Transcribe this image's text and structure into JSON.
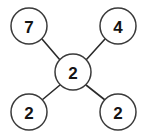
{
  "diagram": {
    "background_color": "#ffffff",
    "node_fill": "#ffffff",
    "node_stroke": "#3a3a3a",
    "edge_color": "#2b2b2b",
    "label_color": "#141414",
    "nodes": [
      {
        "id": "top-left",
        "label": "7",
        "cx": 29,
        "cy": 26,
        "r": 18
      },
      {
        "id": "top-right",
        "label": "4",
        "cx": 118,
        "cy": 26,
        "r": 18
      },
      {
        "id": "center",
        "label": "2",
        "cx": 73,
        "cy": 72,
        "r": 18
      },
      {
        "id": "bottom-left",
        "label": "2",
        "cx": 29,
        "cy": 112,
        "r": 18
      },
      {
        "id": "bottom-right",
        "label": "2",
        "cx": 118,
        "cy": 112,
        "r": 18
      }
    ],
    "edges": [
      {
        "id": "edge-center-top-left",
        "from": "center",
        "to": "top-left",
        "x1": 60,
        "y1": 60,
        "x2": 42,
        "y2": 39
      },
      {
        "id": "edge-center-top-right",
        "from": "center",
        "to": "top-right",
        "x1": 86,
        "y1": 60,
        "x2": 105,
        "y2": 39
      },
      {
        "id": "edge-center-bottom-left",
        "from": "center",
        "to": "bottom-left",
        "x1": 60,
        "y1": 85,
        "x2": 42,
        "y2": 100
      },
      {
        "id": "edge-center-bottom-right",
        "from": "center",
        "to": "bottom-right",
        "x1": 86,
        "y1": 85,
        "x2": 105,
        "y2": 100
      }
    ]
  }
}
